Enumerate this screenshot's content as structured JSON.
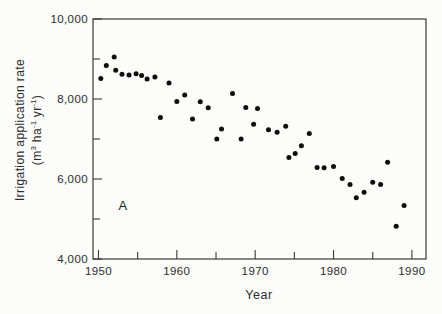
{
  "figure": {
    "kind": "scanned scatter plot, black round markers on white, full box frame, inward ticks"
  },
  "chart_data": {
    "type": "scatter",
    "title": "",
    "xlabel": "Year",
    "ylabel_text": "Irrigation application rate (m³ ha⁻¹ yr⁻¹)",
    "ylabel_line1": "Irrigation application rate",
    "ylabel_line2_parts": [
      {
        "t": "(m"
      },
      {
        "t": "3",
        "sup": true
      },
      {
        "t": " ha"
      },
      {
        "t": "-1",
        "sup": true
      },
      {
        "t": " yr"
      },
      {
        "t": "-1",
        "sup": true
      },
      {
        "t": ")"
      }
    ],
    "annotation": {
      "label": "A",
      "x": 1953.1,
      "y": 5350
    },
    "xlim": [
      1949.3,
      1991.8
    ],
    "ylim": [
      4000,
      10000
    ],
    "x_major_ticks": [
      1950,
      1960,
      1970,
      1980,
      1990
    ],
    "x_tick_labels": [
      "1950",
      "1960",
      "1970",
      "1980",
      "1990"
    ],
    "x_minor_ticks": [
      1955,
      1965,
      1975,
      1985
    ],
    "y_major_ticks": [
      10000,
      8000,
      6000,
      4000
    ],
    "y_tick_labels": [
      "10,000",
      "8,000",
      "6,000",
      "4,000"
    ],
    "y_minor_ticks": [
      9000,
      7000,
      5000
    ],
    "grid": false,
    "legend": null,
    "marker": {
      "shape": "circle",
      "color": "#0e0e0e",
      "diameter_px": 5
    },
    "frame_color": "#3a3a3a",
    "points": [
      [
        1950.3,
        8510
      ],
      [
        1951.0,
        8840
      ],
      [
        1952.0,
        9050
      ],
      [
        1952.2,
        8720
      ],
      [
        1953.0,
        8620
      ],
      [
        1953.9,
        8600
      ],
      [
        1954.8,
        8630
      ],
      [
        1955.5,
        8590
      ],
      [
        1956.2,
        8500
      ],
      [
        1957.2,
        8550
      ],
      [
        1957.9,
        7540
      ],
      [
        1959.0,
        8400
      ],
      [
        1960.0,
        7940
      ],
      [
        1961.0,
        8100
      ],
      [
        1962.0,
        7500
      ],
      [
        1963.0,
        7930
      ],
      [
        1964.0,
        7780
      ],
      [
        1965.1,
        7000
      ],
      [
        1965.7,
        7250
      ],
      [
        1967.1,
        8140
      ],
      [
        1968.2,
        7000
      ],
      [
        1968.8,
        7790
      ],
      [
        1969.8,
        7370
      ],
      [
        1970.3,
        7760
      ],
      [
        1971.7,
        7230
      ],
      [
        1972.8,
        7170
      ],
      [
        1973.9,
        7320
      ],
      [
        1974.3,
        6540
      ],
      [
        1975.1,
        6640
      ],
      [
        1975.9,
        6830
      ],
      [
        1976.9,
        7140
      ],
      [
        1977.9,
        6290
      ],
      [
        1978.8,
        6280
      ],
      [
        1980.0,
        6310
      ],
      [
        1981.1,
        6010
      ],
      [
        1982.1,
        5860
      ],
      [
        1982.9,
        5530
      ],
      [
        1983.9,
        5670
      ],
      [
        1985.0,
        5920
      ],
      [
        1986.0,
        5860
      ],
      [
        1986.9,
        6420
      ],
      [
        1988.0,
        4820
      ],
      [
        1989.0,
        5340
      ]
    ]
  }
}
